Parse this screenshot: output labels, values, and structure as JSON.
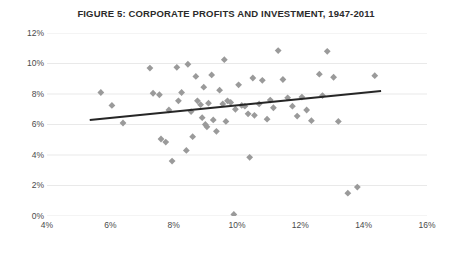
{
  "figure": {
    "title": "FIGURE 5: CORPORATE PROFITS AND INVESTMENT, 1947-2011",
    "caption_partial": "",
    "background_color": "#ffffff"
  },
  "style": {
    "marker_color": "#9a9a9a",
    "trendline_color": "#262626",
    "gridline_color": "#e9e9e9",
    "axis_label_color": "#4a4a4a",
    "title_color": "#2b2b2b"
  },
  "chart_data": {
    "type": "scatter",
    "title": "FIGURE 5: CORPORATE PROFITS AND INVESTMENT, 1947-2011",
    "xlabel": "",
    "ylabel": "",
    "xlim": [
      4,
      16
    ],
    "ylim": [
      0,
      12
    ],
    "xticks": [
      4,
      6,
      8,
      10,
      12,
      14,
      16
    ],
    "yticks": [
      0,
      2,
      4,
      6,
      8,
      10,
      12
    ],
    "xtick_labels": [
      "4%",
      "6%",
      "8%",
      "10%",
      "12%",
      "14%",
      "16%"
    ],
    "ytick_labels": [
      "0%",
      "2%",
      "4%",
      "6%",
      "8%",
      "10%",
      "12%"
    ],
    "grid": "horizontal",
    "legend": "none",
    "marker": "diamond",
    "points": [
      [
        5.7,
        8.1
      ],
      [
        6.05,
        7.25
      ],
      [
        6.4,
        6.1
      ],
      [
        7.25,
        9.7
      ],
      [
        7.35,
        8.05
      ],
      [
        7.55,
        7.95
      ],
      [
        7.6,
        5.05
      ],
      [
        7.75,
        4.85
      ],
      [
        7.85,
        6.95
      ],
      [
        7.95,
        3.6
      ],
      [
        8.1,
        9.75
      ],
      [
        8.15,
        7.55
      ],
      [
        8.25,
        8.1
      ],
      [
        8.4,
        4.3
      ],
      [
        8.45,
        9.95
      ],
      [
        8.55,
        6.85
      ],
      [
        8.6,
        5.2
      ],
      [
        8.7,
        9.15
      ],
      [
        8.75,
        7.55
      ],
      [
        8.85,
        7.3
      ],
      [
        8.9,
        6.45
      ],
      [
        8.95,
        8.45
      ],
      [
        9.0,
        6.0
      ],
      [
        9.05,
        5.85
      ],
      [
        9.1,
        7.4
      ],
      [
        9.2,
        9.25
      ],
      [
        9.25,
        6.3
      ],
      [
        9.35,
        5.55
      ],
      [
        9.45,
        8.25
      ],
      [
        9.55,
        7.35
      ],
      [
        9.6,
        10.25
      ],
      [
        9.65,
        6.2
      ],
      [
        9.7,
        7.55
      ],
      [
        9.8,
        7.45
      ],
      [
        9.9,
        0.1
      ],
      [
        9.95,
        7.0
      ],
      [
        10.05,
        8.6
      ],
      [
        10.15,
        7.25
      ],
      [
        10.25,
        7.2
      ],
      [
        10.35,
        6.7
      ],
      [
        10.4,
        3.85
      ],
      [
        10.5,
        9.05
      ],
      [
        10.55,
        6.6
      ],
      [
        10.7,
        7.35
      ],
      [
        10.8,
        8.9
      ],
      [
        10.95,
        6.35
      ],
      [
        11.05,
        7.6
      ],
      [
        11.15,
        7.1
      ],
      [
        11.3,
        10.85
      ],
      [
        11.45,
        8.95
      ],
      [
        11.6,
        7.75
      ],
      [
        11.75,
        7.2
      ],
      [
        11.9,
        6.55
      ],
      [
        12.05,
        7.8
      ],
      [
        12.2,
        6.95
      ],
      [
        12.35,
        6.25
      ],
      [
        12.6,
        9.3
      ],
      [
        12.7,
        7.9
      ],
      [
        12.85,
        10.8
      ],
      [
        13.05,
        9.1
      ],
      [
        13.2,
        6.2
      ],
      [
        13.5,
        1.5
      ],
      [
        13.8,
        1.9
      ],
      [
        14.35,
        9.2
      ]
    ],
    "trendline": {
      "x": [
        5.35,
        14.55
      ],
      "y": [
        6.3,
        8.2
      ]
    }
  }
}
